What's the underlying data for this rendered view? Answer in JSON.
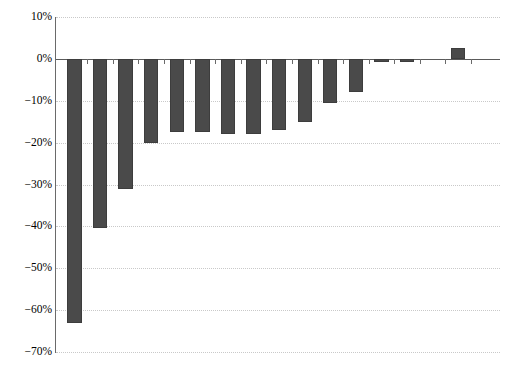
{
  "chart_data": {
    "type": "bar",
    "title": "",
    "subtitle": "",
    "xlabel": "",
    "ylabel": "",
    "ylim": [
      -70,
      10
    ],
    "ytick_values": [
      10,
      0,
      -10,
      -20,
      -30,
      -40,
      -50,
      -60,
      -70
    ],
    "ytick_labels": [
      "10%",
      "0%",
      "−10%",
      "−20%",
      "−30%",
      "−40%",
      "−50%",
      "−60%",
      "−70%"
    ],
    "xtick_labels": [],
    "grid": true,
    "legend": false,
    "legend_position": "none",
    "bar_color": "#4a4a4a",
    "axis_color": "#6a6a6a",
    "gridline_color": "#c9c9c9",
    "background_color": "#ffffff",
    "categories": [
      "1",
      "2",
      "3",
      "4",
      "5",
      "6",
      "7",
      "8",
      "9",
      "10",
      "11",
      "12",
      "13",
      "14",
      "15",
      "16"
    ],
    "values": [
      -63.0,
      -40.5,
      -31.0,
      -20.0,
      -17.5,
      -17.5,
      -18.0,
      -18.0,
      -17.0,
      -15.0,
      -10.5,
      -8.0,
      -0.8,
      -0.8,
      0.0,
      2.5
    ],
    "value_labels": [
      "-63%",
      "-40.5%",
      "-31%",
      "-20%",
      "-17.5%",
      "-17.5%",
      "-18%",
      "-18%",
      "-17%",
      "-15%",
      "-10.5%",
      "-8%",
      "-0.8%",
      "-0.8%",
      "0%",
      "2.5%"
    ],
    "n_bars": 16
  }
}
